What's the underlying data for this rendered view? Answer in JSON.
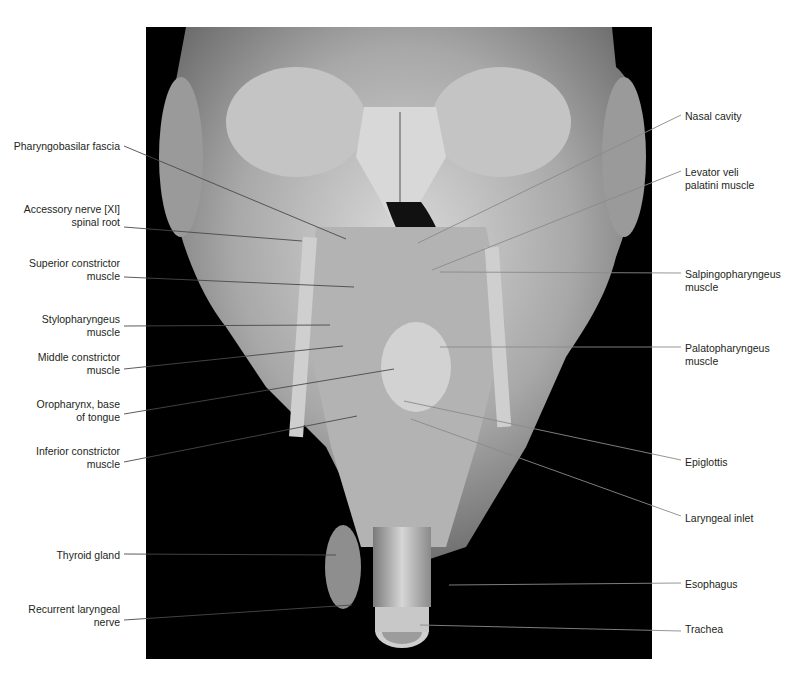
{
  "figure": {
    "background": "#000000",
    "tissue_color": "#b8b8b8",
    "leader_color": "#4a4a4a"
  },
  "labels": {
    "left": [
      {
        "text": "Pharyngobasilar fascia",
        "top": 140,
        "line": [
          124,
          146,
          346,
          239
        ]
      },
      {
        "text": "Accessory nerve [XI]\nspinal root",
        "top": 203,
        "line": [
          124,
          227,
          302,
          241
        ]
      },
      {
        "text": "Superior constrictor\nmuscle",
        "top": 257,
        "line": [
          124,
          277,
          354,
          287
        ]
      },
      {
        "text": "Stylopharyngeus\nmuscle",
        "top": 313,
        "line": [
          124,
          326,
          330,
          325
        ]
      },
      {
        "text": "Middle constrictor\nmuscle",
        "top": 351,
        "line": [
          124,
          369,
          343,
          346
        ]
      },
      {
        "text": "Oropharynx, base\nof tongue",
        "top": 398,
        "line": [
          124,
          414,
          394,
          369
        ]
      },
      {
        "text": "Inferior constrictor\nmuscle",
        "top": 445,
        "line": [
          124,
          462,
          357,
          416
        ]
      },
      {
        "text": "Thyroid gland",
        "top": 549,
        "line": [
          124,
          554,
          336,
          555
        ]
      },
      {
        "text": "Recurrent laryngeal\nnerve",
        "top": 603,
        "line": [
          124,
          620,
          352,
          605
        ]
      }
    ],
    "right": [
      {
        "text": "Nasal cavity",
        "top": 110,
        "line": [
          681,
          115,
          418,
          243
        ]
      },
      {
        "text": "Levator veli\npalatini muscle",
        "top": 166,
        "line": [
          681,
          171,
          432,
          270
        ]
      },
      {
        "text": "Salpingopharyngeus\nmuscle",
        "top": 268,
        "line": [
          681,
          273,
          440,
          272
        ]
      },
      {
        "text": "Palatopharyngeus\nmuscle",
        "top": 342,
        "line": [
          681,
          347,
          440,
          347
        ]
      },
      {
        "text": "Epiglottis",
        "top": 456,
        "line": [
          681,
          460,
          404,
          401
        ]
      },
      {
        "text": "Laryngeal inlet",
        "top": 512,
        "line": [
          681,
          516,
          411,
          419
        ]
      },
      {
        "text": "Esophagus",
        "top": 578,
        "line": [
          681,
          583,
          449,
          585
        ]
      },
      {
        "text": "Trachea",
        "top": 623,
        "line": [
          681,
          631,
          420,
          625
        ]
      }
    ]
  }
}
